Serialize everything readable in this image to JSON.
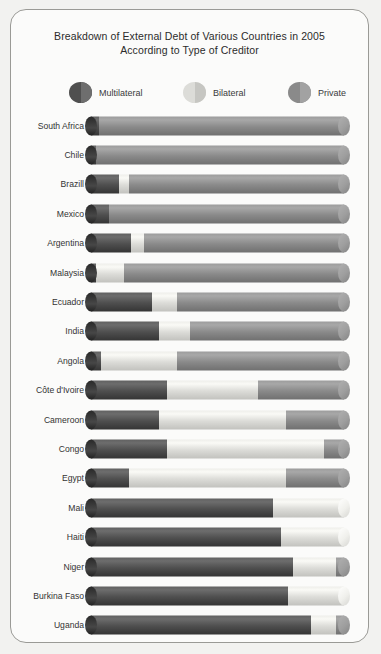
{
  "chart_data": {
    "type": "bar",
    "orientation": "horizontal",
    "stacked": true,
    "normalized": true,
    "title": "Breakdown of External Debt of Various Countries in 2005 According to Type of Creditor",
    "title_line1": "Breakdown of External Debt of Various Countries in 2005",
    "title_line2": "According to Type of Creditor",
    "xlabel": "",
    "ylabel": "",
    "xlim": [
      0,
      100
    ],
    "grid": false,
    "legend_position": "top",
    "units": "percent of total external debt",
    "categories": [
      "South Africa",
      "Chile",
      "Brazill",
      "Mexico",
      "Argentina",
      "Malaysia",
      "Ecuador",
      "India",
      "Angola",
      "Côte d'Ivoire",
      "Cameroon",
      "Congo",
      "Egypt",
      "Mali",
      "Haiti",
      "Niger",
      "Burkina Faso",
      "Uganda"
    ],
    "series": [
      {
        "name": "Multilateral",
        "color": "#4f4f4f",
        "values": [
          3,
          2,
          11,
          7,
          16,
          2,
          24,
          27,
          4,
          30,
          27,
          30,
          15,
          72,
          75,
          80,
          78,
          87
        ]
      },
      {
        "name": "Bilateral",
        "color": "#dcdcd8",
        "values": [
          0,
          0,
          4,
          0,
          5,
          11,
          10,
          12,
          30,
          36,
          50,
          62,
          62,
          28,
          25,
          17,
          22,
          10
        ]
      },
      {
        "name": "Private",
        "color": "#8a8a8a",
        "values": [
          97,
          98,
          85,
          93,
          79,
          87,
          66,
          61,
          66,
          34,
          23,
          8,
          23,
          0,
          0,
          3,
          0,
          3
        ]
      }
    ]
  },
  "legend": {
    "items": [
      {
        "label": "Multilateral",
        "swatch": "legend-swatch-multilateral",
        "color": "#4f4f4f",
        "cap": "#6e6e6e"
      },
      {
        "label": "Bilateral",
        "swatch": "legend-swatch-bilateral",
        "color": "#dcdcd8",
        "cap": "#c6c6c2"
      },
      {
        "label": "Private",
        "swatch": "legend-swatch-private",
        "color": "#8a8a8a",
        "cap": "#a2a2a2"
      }
    ]
  },
  "panel": {
    "background": "#fbfbfa",
    "border_color": "#9a9a96"
  }
}
